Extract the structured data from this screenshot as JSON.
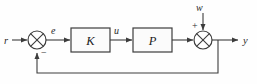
{
  "diagram": {
    "type": "control-block-diagram",
    "background_color": "#fefefe",
    "line_color": "#3c3c3c",
    "block_fill": "#fbfbfb",
    "text_color": "#1a1a1a",
    "blocks": [
      {
        "id": "controller",
        "label": "K",
        "x": 71,
        "y": 28,
        "w": 39,
        "h": 24
      },
      {
        "id": "plant",
        "label": "P",
        "x": 133,
        "y": 28,
        "w": 39,
        "h": 24
      }
    ],
    "junctions": [
      {
        "id": "error-sum",
        "glyph": "circle-x",
        "cx": 37,
        "cy": 40,
        "r": 9
      },
      {
        "id": "output-sum",
        "glyph": "circle-x",
        "cx": 203,
        "cy": 40,
        "r": 9
      }
    ],
    "signals": [
      {
        "id": "reference",
        "label": "r",
        "x": 4,
        "y": 38
      },
      {
        "id": "error",
        "label": "e",
        "x": 52,
        "y": 31
      },
      {
        "id": "control",
        "label": "u",
        "x": 115,
        "y": 31
      },
      {
        "id": "disturbance",
        "label": "w",
        "x": 196,
        "y": 10
      },
      {
        "id": "output",
        "label": "y",
        "x": 244,
        "y": 38
      }
    ],
    "signs": [
      {
        "id": "feedback-sign",
        "label": "−",
        "x": 41,
        "y": 56
      },
      {
        "id": "disturbance-sign",
        "label": "+",
        "x": 192,
        "y": 26
      }
    ]
  }
}
